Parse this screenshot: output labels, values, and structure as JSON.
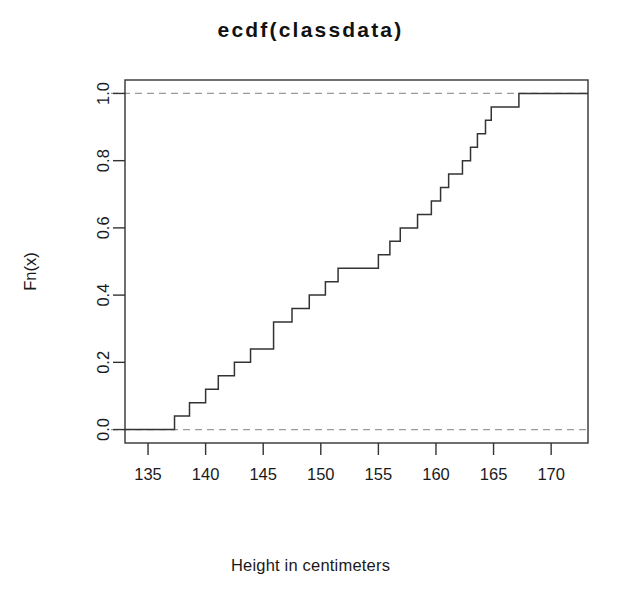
{
  "chart_data": {
    "type": "line",
    "subtype": "ecdf-step",
    "title": "ecdf(classdata)",
    "xlabel": "Height in centimeters",
    "ylabel": "Fn(x)",
    "xlim": [
      133.0,
      173.2
    ],
    "ylim": [
      -0.04,
      1.04
    ],
    "xticks": [
      135,
      140,
      145,
      150,
      155,
      160,
      165,
      170
    ],
    "yticks": [
      0.0,
      0.2,
      0.4,
      0.6,
      0.8,
      1.0
    ],
    "xtick_labels": [
      "135",
      "140",
      "145",
      "150",
      "155",
      "160",
      "165",
      "170"
    ],
    "ytick_labels": [
      "0.0",
      "0.2",
      "0.4",
      "0.6",
      "0.8",
      "1.0"
    ],
    "grid": false,
    "legend": false,
    "n": 25,
    "step_increment": 0.04,
    "reference_lines": [
      {
        "y": 0.0,
        "style": "dashed",
        "color": "#9a9a9a"
      },
      {
        "y": 1.0,
        "style": "dashed",
        "color": "#9a9a9a"
      }
    ],
    "series": [
      {
        "name": "ecdf(classdata)",
        "color": "#333333",
        "x": [
          137.3,
          138.6,
          140.0,
          141.1,
          142.5,
          143.9,
          145.9,
          147.5,
          149.0,
          150.4,
          151.5,
          155.0,
          156.0,
          156.9,
          158.4,
          159.6,
          160.4,
          161.1,
          162.3,
          163.0,
          163.6,
          164.3,
          164.8,
          167.2
        ],
        "y": [
          0.04,
          0.08,
          0.12,
          0.16,
          0.2,
          0.24,
          0.32,
          0.36,
          0.4,
          0.44,
          0.48,
          0.52,
          0.56,
          0.6,
          0.64,
          0.68,
          0.72,
          0.76,
          0.8,
          0.84,
          0.88,
          0.92,
          0.96,
          1.0
        ],
        "left_tail_y": 0.0,
        "right_tail_y": 1.0
      }
    ]
  },
  "axes": {
    "box_color": "#333333",
    "tick_color": "#333333"
  },
  "title": "ecdf(classdata)",
  "xlabel": "Height in centimeters",
  "ylabel": "Fn(x)"
}
